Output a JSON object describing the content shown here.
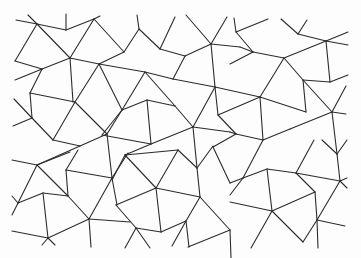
{
  "figure": {
    "background": "#fdfdfd",
    "stroke": "#2b2b2b",
    "width": 361,
    "height": 258
  },
  "segments": [
    [
      16,
      20,
      37,
      24
    ],
    [
      28,
      15,
      37,
      24
    ],
    [
      37,
      24,
      66,
      30
    ],
    [
      66,
      14,
      66,
      30
    ],
    [
      66,
      30,
      94,
      19
    ],
    [
      94,
      19,
      100,
      16
    ],
    [
      37,
      24,
      70,
      58
    ],
    [
      37,
      24,
      15,
      61
    ],
    [
      15,
      61,
      42,
      69
    ],
    [
      94,
      19,
      70,
      58
    ],
    [
      94,
      19,
      124,
      52
    ],
    [
      70,
      58,
      99,
      64
    ],
    [
      70,
      58,
      42,
      69
    ],
    [
      70,
      58,
      73,
      102
    ],
    [
      42,
      69,
      15,
      80
    ],
    [
      42,
      69,
      30,
      93
    ],
    [
      99,
      64,
      124,
      52
    ],
    [
      99,
      64,
      122,
      110
    ],
    [
      99,
      64,
      145,
      72
    ],
    [
      137,
      15,
      139,
      29
    ],
    [
      139,
      29,
      124,
      52
    ],
    [
      139,
      29,
      160,
      49
    ],
    [
      160,
      49,
      175,
      17
    ],
    [
      160,
      49,
      185,
      56
    ],
    [
      185,
      56,
      211,
      44
    ],
    [
      211,
      44,
      186,
      15
    ],
    [
      211,
      44,
      227,
      17
    ],
    [
      211,
      44,
      240,
      47
    ],
    [
      211,
      44,
      215,
      87
    ],
    [
      185,
      56,
      173,
      79
    ],
    [
      173,
      79,
      215,
      87
    ],
    [
      145,
      72,
      173,
      79
    ],
    [
      145,
      72,
      122,
      110
    ],
    [
      145,
      72,
      175,
      106
    ],
    [
      234,
      18,
      236,
      32
    ],
    [
      236,
      32,
      268,
      19
    ],
    [
      236,
      32,
      253,
      52
    ],
    [
      240,
      47,
      253,
      52
    ],
    [
      253,
      52,
      284,
      58
    ],
    [
      253,
      52,
      230,
      64
    ],
    [
      281,
      19,
      298,
      34
    ],
    [
      298,
      34,
      307,
      20
    ],
    [
      298,
      34,
      326,
      41
    ],
    [
      326,
      41,
      348,
      32
    ],
    [
      326,
      41,
      348,
      45
    ],
    [
      326,
      41,
      284,
      58
    ],
    [
      326,
      41,
      330,
      82
    ],
    [
      284,
      58,
      260,
      97
    ],
    [
      284,
      58,
      303,
      80
    ],
    [
      303,
      80,
      330,
      82
    ],
    [
      330,
      82,
      348,
      75
    ],
    [
      30,
      93,
      75,
      102
    ],
    [
      75,
      102,
      99,
      64
    ],
    [
      75,
      102,
      53,
      140
    ],
    [
      75,
      102,
      107,
      134
    ],
    [
      14,
      99,
      32,
      118
    ],
    [
      32,
      118,
      13,
      126
    ],
    [
      30,
      93,
      32,
      118
    ],
    [
      32,
      118,
      53,
      140
    ],
    [
      53,
      140,
      80,
      146
    ],
    [
      80,
      146,
      107,
      134
    ],
    [
      80,
      146,
      37,
      165
    ],
    [
      107,
      134,
      122,
      110
    ],
    [
      107,
      134,
      112,
      178
    ],
    [
      12,
      160,
      37,
      165
    ],
    [
      122,
      110,
      147,
      100
    ],
    [
      147,
      100,
      175,
      106
    ],
    [
      147,
      100,
      151,
      144
    ],
    [
      122,
      110,
      102,
      135
    ],
    [
      102,
      135,
      151,
      144
    ],
    [
      151,
      144,
      193,
      127
    ],
    [
      175,
      106,
      193,
      127
    ],
    [
      193,
      127,
      215,
      87
    ],
    [
      193,
      127,
      230,
      132
    ],
    [
      193,
      127,
      197,
      168
    ],
    [
      215,
      87,
      218,
      115
    ],
    [
      215,
      87,
      260,
      97
    ],
    [
      260,
      97,
      218,
      115
    ],
    [
      260,
      97,
      306,
      112
    ],
    [
      260,
      97,
      263,
      140
    ],
    [
      303,
      80,
      306,
      112
    ],
    [
      303,
      80,
      332,
      112
    ],
    [
      332,
      112,
      346,
      114
    ],
    [
      332,
      112,
      346,
      86
    ],
    [
      332,
      112,
      290,
      129
    ],
    [
      332,
      112,
      337,
      154
    ],
    [
      218,
      115,
      236,
      134
    ],
    [
      230,
      132,
      236,
      134
    ],
    [
      236,
      134,
      263,
      140
    ],
    [
      263,
      140,
      290,
      129
    ],
    [
      236,
      134,
      213,
      147
    ],
    [
      37,
      165,
      70,
      152
    ],
    [
      37,
      165,
      18,
      203
    ],
    [
      37,
      165,
      68,
      196
    ],
    [
      66,
      170,
      78,
      150
    ],
    [
      66,
      170,
      112,
      178
    ],
    [
      66,
      170,
      68,
      196
    ],
    [
      112,
      178,
      128,
      153
    ],
    [
      112,
      178,
      89,
      219
    ],
    [
      112,
      178,
      117,
      205
    ],
    [
      43,
      193,
      18,
      203
    ],
    [
      43,
      193,
      68,
      196
    ],
    [
      43,
      193,
      48,
      238
    ],
    [
      12,
      196,
      18,
      203
    ],
    [
      18,
      203,
      12,
      215
    ],
    [
      68,
      196,
      89,
      219
    ],
    [
      89,
      219,
      130,
      222
    ],
    [
      89,
      219,
      48,
      238
    ],
    [
      89,
      219,
      91,
      247
    ],
    [
      12,
      231,
      48,
      238
    ],
    [
      48,
      238,
      42,
      245
    ],
    [
      48,
      238,
      55,
      245
    ],
    [
      151,
      144,
      125,
      155
    ],
    [
      125,
      155,
      178,
      150
    ],
    [
      125,
      155,
      112,
      180
    ],
    [
      125,
      155,
      156,
      188
    ],
    [
      178,
      150,
      156,
      188
    ],
    [
      178,
      150,
      197,
      168
    ],
    [
      197,
      168,
      213,
      146
    ],
    [
      197,
      168,
      200,
      197
    ],
    [
      156,
      188,
      200,
      197
    ],
    [
      156,
      188,
      116,
      205
    ],
    [
      156,
      188,
      161,
      232
    ],
    [
      116,
      205,
      136,
      228
    ],
    [
      136,
      228,
      161,
      232
    ],
    [
      161,
      232,
      186,
      221
    ],
    [
      186,
      221,
      200,
      197
    ],
    [
      200,
      197,
      230,
      230
    ],
    [
      186,
      221,
      189,
      247
    ],
    [
      136,
      228,
      125,
      248
    ],
    [
      136,
      228,
      150,
      248
    ],
    [
      186,
      221,
      172,
      246
    ],
    [
      230,
      230,
      188,
      247
    ],
    [
      230,
      230,
      231,
      258
    ],
    [
      263,
      140,
      243,
      178
    ],
    [
      314,
      140,
      296,
      173
    ],
    [
      230,
      183,
      243,
      178
    ],
    [
      243,
      178,
      267,
      169
    ],
    [
      267,
      169,
      296,
      173
    ],
    [
      267,
      169,
      272,
      211
    ],
    [
      296,
      173,
      315,
      192
    ],
    [
      296,
      173,
      340,
      181
    ],
    [
      337,
      154,
      340,
      181
    ],
    [
      340,
      181,
      347,
      188
    ],
    [
      340,
      181,
      347,
      178
    ],
    [
      315,
      192,
      272,
      211
    ],
    [
      315,
      192,
      317,
      220
    ],
    [
      272,
      211,
      230,
      202
    ],
    [
      272,
      211,
      251,
      248
    ],
    [
      272,
      211,
      303,
      242
    ],
    [
      317,
      220,
      303,
      242
    ],
    [
      317,
      220,
      340,
      181
    ],
    [
      317,
      220,
      345,
      226
    ],
    [
      317,
      220,
      318,
      248
    ],
    [
      243,
      178,
      230,
      195
    ],
    [
      322,
      140,
      337,
      154
    ],
    [
      337,
      154,
      347,
      140
    ],
    [
      213,
      147,
      230,
      183
    ]
  ]
}
